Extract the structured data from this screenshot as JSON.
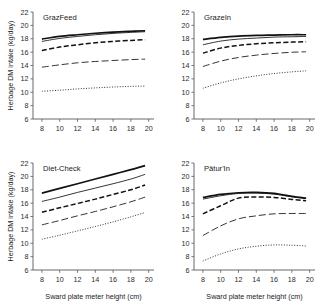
{
  "figure": {
    "background": "#ffffff",
    "line_color": "#111111",
    "xlabel": "Sward plate meter height (cm)",
    "ylabel": "Herbage DM intake (kg/day)"
  },
  "axes": {
    "xticks": [
      8,
      10,
      12,
      14,
      16,
      18,
      20
    ],
    "yticks": [
      6,
      8,
      10,
      12,
      14,
      16,
      18,
      20,
      22
    ],
    "xlim": [
      7.0,
      20.6
    ],
    "ylim": [
      6,
      22
    ]
  },
  "series_styles": [
    {
      "name": "series-1",
      "style": "thick-solid",
      "dash": "none",
      "width": 1.7
    },
    {
      "name": "series-2",
      "style": "thin-solid",
      "dash": "none",
      "width": 0.85
    },
    {
      "name": "series-3",
      "style": "dashed",
      "dash": "5,2.4",
      "width": 1.5
    },
    {
      "name": "series-4",
      "style": "long-dash",
      "dash": "7,3",
      "width": 0.85
    },
    {
      "name": "series-5",
      "style": "dotted",
      "dash": "1,1.6",
      "width": 0.85
    }
  ],
  "chart_data": [
    {
      "type": "line",
      "title": "GrazFeed",
      "xlabel": "Sward plate meter height (cm)",
      "ylabel": "Herbage DM intake (kg/day)",
      "xlim": [
        7.0,
        20.6
      ],
      "ylim": [
        6,
        22
      ],
      "grid": false,
      "legend": "none",
      "x": [
        8,
        10,
        12,
        14,
        16,
        18,
        19.6
      ],
      "series": [
        {
          "name": "series-1",
          "style": "thick-solid",
          "values": [
            17.95,
            18.35,
            18.6,
            18.82,
            19.0,
            19.12,
            19.2
          ]
        },
        {
          "name": "series-2",
          "style": "thin-solid",
          "values": [
            17.6,
            18.05,
            18.35,
            18.6,
            18.8,
            18.95,
            19.05
          ]
        },
        {
          "name": "series-3",
          "style": "dashed",
          "values": [
            16.25,
            16.75,
            17.1,
            17.4,
            17.6,
            17.75,
            17.85
          ]
        },
        {
          "name": "series-4",
          "style": "long-dash",
          "values": [
            13.75,
            14.1,
            14.4,
            14.6,
            14.75,
            14.88,
            14.95
          ]
        },
        {
          "name": "series-5",
          "style": "dotted",
          "values": [
            10.15,
            10.3,
            10.5,
            10.65,
            10.78,
            10.88,
            10.92
          ]
        }
      ]
    },
    {
      "type": "line",
      "title": "GrazeIn",
      "xlabel": "Sward plate meter height (cm)",
      "ylabel": "Herbage DM intake (kg/day)",
      "xlim": [
        7.0,
        20.6
      ],
      "ylim": [
        6,
        22
      ],
      "grid": false,
      "legend": "none",
      "x": [
        8,
        10,
        12,
        14,
        16,
        18,
        19.6
      ],
      "series": [
        {
          "name": "series-1",
          "style": "thick-solid",
          "values": [
            17.9,
            18.2,
            18.4,
            18.5,
            18.55,
            18.6,
            18.6
          ]
        },
        {
          "name": "series-2",
          "style": "thin-solid",
          "values": [
            17.1,
            17.65,
            17.95,
            18.1,
            18.25,
            18.3,
            18.35
          ]
        },
        {
          "name": "series-3",
          "style": "dashed",
          "values": [
            15.85,
            16.6,
            17.0,
            17.25,
            17.4,
            17.5,
            17.55
          ]
        },
        {
          "name": "series-4",
          "style": "long-dash",
          "values": [
            13.85,
            14.65,
            15.2,
            15.55,
            15.8,
            15.98,
            16.05
          ]
        },
        {
          "name": "series-5",
          "style": "dotted",
          "values": [
            10.6,
            11.4,
            12.0,
            12.45,
            12.8,
            13.05,
            13.2
          ]
        }
      ]
    },
    {
      "type": "line",
      "title": "Diet-Check",
      "xlabel": "Sward plate meter height (cm)",
      "ylabel": "Herbage DM intake (kg/day)",
      "xlim": [
        7.0,
        20.6
      ],
      "ylim": [
        6,
        22
      ],
      "grid": false,
      "legend": "none",
      "x": [
        8,
        10,
        12,
        14,
        16,
        18,
        19.6
      ],
      "series": [
        {
          "name": "series-1",
          "style": "thick-solid",
          "values": [
            17.5,
            18.2,
            18.9,
            19.6,
            20.3,
            21.0,
            21.6
          ]
        },
        {
          "name": "series-2",
          "style": "thin-solid",
          "values": [
            16.25,
            16.9,
            17.6,
            18.25,
            18.9,
            19.6,
            20.3
          ]
        },
        {
          "name": "series-3",
          "style": "dashed",
          "values": [
            14.65,
            15.3,
            15.95,
            16.6,
            17.3,
            18.0,
            18.7
          ]
        },
        {
          "name": "series-4",
          "style": "long-dash",
          "values": [
            12.75,
            13.4,
            14.1,
            14.75,
            15.45,
            16.2,
            16.9
          ]
        },
        {
          "name": "series-5",
          "style": "dotted",
          "values": [
            10.6,
            11.2,
            11.85,
            12.5,
            13.2,
            13.95,
            14.6
          ]
        }
      ]
    },
    {
      "type": "line",
      "title": "Pâtur'In",
      "xlabel": "Sward plate meter height (cm)",
      "ylabel": "Herbage DM intake (kg/day)",
      "xlim": [
        7.0,
        20.6
      ],
      "ylim": [
        6,
        22
      ],
      "grid": false,
      "legend": "none",
      "x": [
        8,
        10,
        12,
        14,
        16,
        18,
        19.6
      ],
      "series": [
        {
          "name": "series-1",
          "style": "thick-solid",
          "values": [
            16.85,
            17.3,
            17.55,
            17.6,
            17.45,
            17.0,
            16.75
          ]
        },
        {
          "name": "series-2",
          "style": "thin-solid",
          "values": [
            16.6,
            17.1,
            17.45,
            17.5,
            17.35,
            16.95,
            16.7
          ]
        },
        {
          "name": "series-3",
          "style": "dashed",
          "values": [
            14.4,
            15.6,
            16.75,
            16.9,
            16.85,
            16.55,
            16.35
          ]
        },
        {
          "name": "series-4",
          "style": "long-dash",
          "values": [
            11.15,
            12.6,
            13.65,
            14.1,
            14.4,
            14.45,
            14.45
          ]
        },
        {
          "name": "series-5",
          "style": "dotted",
          "values": [
            7.35,
            8.4,
            9.15,
            9.55,
            9.75,
            9.7,
            9.6
          ]
        }
      ]
    }
  ]
}
